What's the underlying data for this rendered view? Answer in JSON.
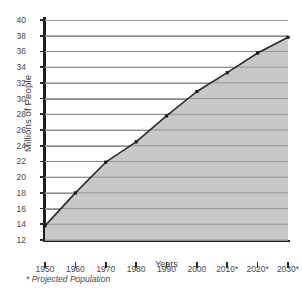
{
  "chart_data": {
    "type": "area",
    "title": "",
    "xlabel": "Years",
    "ylabel": "Millions of People",
    "categories": [
      "1950",
      "1960",
      "1970",
      "1980",
      "1990",
      "2000",
      "2010*",
      "2020*",
      "2030*"
    ],
    "values": [
      13.8,
      18.0,
      21.9,
      24.5,
      27.8,
      30.9,
      33.3,
      35.8,
      37.8
    ],
    "series": [
      {
        "name": "Population",
        "values": [
          13.8,
          18.0,
          21.9,
          24.5,
          27.8,
          30.9,
          33.3,
          35.8,
          37.8
        ]
      }
    ],
    "ylim": [
      12,
      40
    ],
    "ytick_step": 2,
    "yticks": [
      12,
      14,
      16,
      18,
      20,
      22,
      24,
      26,
      28,
      30,
      32,
      34,
      36,
      38,
      40
    ],
    "ytick_labels": [
      "12",
      "14",
      "16",
      "18",
      "20",
      "22",
      "24",
      "26",
      "28",
      "30",
      "32",
      "34",
      "36",
      "38",
      "40"
    ],
    "xtick_labels": [
      "1950",
      "1960",
      "1970",
      "1980",
      "1990",
      "2000",
      "2010*",
      "2020*",
      "2030*"
    ],
    "grid": true,
    "grid_axis": "y",
    "legend": false,
    "legend_position": "none",
    "markers": true,
    "fill": true,
    "colors": {
      "area_fill": "#c8c8c8",
      "line": "#2b2b2b",
      "marker": "#1a1a1a",
      "gridline": "#8e8e8e",
      "axis": "#1d1d1d",
      "text": "#3d3d3d",
      "background": "#ffffff"
    },
    "annotations": [
      {
        "name": "projected-footnote",
        "text": "* Projected Population"
      }
    ]
  },
  "footnote": {
    "text": "* Projected Population"
  }
}
